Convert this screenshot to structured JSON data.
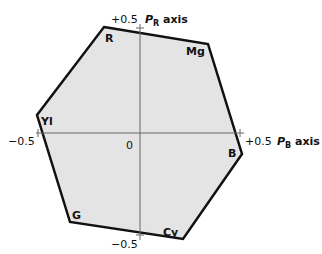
{
  "diagram": {
    "axes": {
      "horizontal": {
        "name_prefix": "P",
        "name_sub": "B",
        "name_suffix": " axis",
        "min_label": "−0.5",
        "max_label": "+0.5"
      },
      "vertical": {
        "name_prefix": "P",
        "name_sub": "R",
        "name_suffix": " axis",
        "min_label": "−0.5",
        "max_label": "+0.5"
      },
      "origin_label": "0"
    },
    "vertices": [
      {
        "label": "R"
      },
      {
        "label": "Mg"
      },
      {
        "label": "B"
      },
      {
        "label": "Cy"
      },
      {
        "label": "G"
      },
      {
        "label": "Yl"
      }
    ],
    "colors": {
      "fill": "#e4e4e4",
      "stroke": "#111111",
      "axis": "#666666"
    }
  }
}
